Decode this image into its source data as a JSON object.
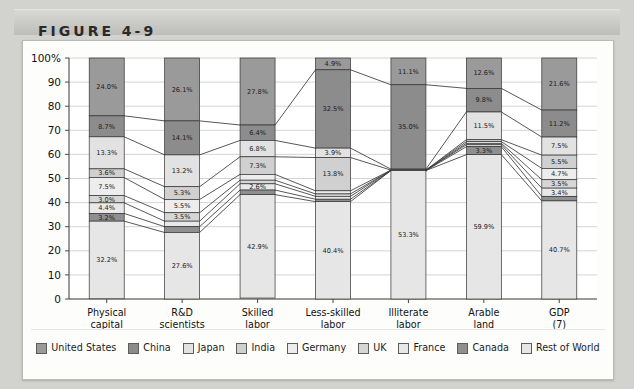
{
  "figure": {
    "label": "FIGURE 4-9"
  },
  "chart_data": {
    "type": "bar",
    "subtype": "stacked-percentage-with-connectors",
    "title": "",
    "xlabel": "",
    "ylabel": "",
    "ylim": [
      0,
      100
    ],
    "ytick_labels": [
      "100%",
      "90",
      "80",
      "70",
      "60",
      "50",
      "40",
      "30",
      "20",
      "10",
      "0"
    ],
    "ytick_values": [
      100,
      90,
      80,
      70,
      60,
      50,
      40,
      30,
      20,
      10,
      0
    ],
    "grid": true,
    "legend_position": "bottom",
    "categories": [
      "Physical capital",
      "R&D scientists",
      "Skilled labor",
      "Less-skilled labor",
      "Illiterate labor",
      "Arable land",
      "GDP"
    ],
    "category_lines": [
      [
        "Physical",
        "capital",
        "(1)"
      ],
      [
        "R&D",
        "scientists",
        "(2)"
      ],
      [
        "Skilled",
        "labor",
        "(3)"
      ],
      [
        "Less-skilled",
        "labor",
        "(4)"
      ],
      [
        "Illiterate",
        "labor",
        "(5)"
      ],
      [
        "Arable",
        "land",
        "(6)"
      ],
      [
        "GDP",
        "(7)"
      ]
    ],
    "series": [
      {
        "name": "United States",
        "color": "#9a9a9a",
        "values": [
          24.0,
          26.1,
          27.8,
          4.9,
          11.1,
          12.6,
          21.6
        ],
        "labels": [
          "24.0%",
          "26.1%",
          "27.8%",
          "4.9%",
          "11.1%",
          "12.6%",
          "21.6%"
        ]
      },
      {
        "name": "China",
        "color": "#8c8c8c",
        "values": [
          8.7,
          14.1,
          6.4,
          32.5,
          35.0,
          9.8,
          11.2
        ],
        "labels": [
          "8.7%",
          "14.1%",
          "6.4%",
          "32.5%",
          "35.0%",
          "9.8%",
          "11.2%"
        ]
      },
      {
        "name": "Japan",
        "color": "#e2e2e2",
        "values": [
          13.3,
          13.2,
          6.8,
          3.9,
          0.4,
          11.5,
          7.5
        ],
        "labels": [
          "13.3%",
          "13.2%",
          "6.8%",
          "3.9%",
          "",
          "11.5%",
          "7.5%"
        ]
      },
      {
        "name": "India",
        "color": "#d0d0d0",
        "values": [
          3.6,
          5.3,
          7.3,
          13.8,
          0.0,
          0.8,
          5.5
        ],
        "labels": [
          "3.6%",
          "5.3%",
          "7.3%",
          "13.8%",
          "",
          "",
          "5.5%"
        ]
      },
      {
        "name": "Germany",
        "color": "#ededed",
        "values": [
          7.5,
          5.5,
          2.4,
          1.3,
          0.1,
          0.7,
          4.7
        ],
        "labels": [
          "7.5%",
          "5.5%",
          "2.4%",
          "",
          "",
          "",
          "4.7%"
        ]
      },
      {
        "name": "UK",
        "color": "#d6d6d6",
        "values": [
          3.0,
          3.5,
          1.5,
          1.0,
          0.0,
          0.6,
          3.5
        ],
        "labels": [
          "3.0%",
          "3.5%",
          "",
          "",
          "",
          "",
          "3.5%"
        ]
      },
      {
        "name": "France",
        "color": "#e8e8e8",
        "values": [
          4.4,
          2.3,
          2.6,
          1.2,
          0.1,
          0.8,
          3.4
        ],
        "labels": [
          "4.4%",
          "",
          "2.6%",
          "",
          "",
          "",
          "3.4%"
        ]
      },
      {
        "name": "Canada",
        "color": "#8f8f8f",
        "values": [
          3.2,
          2.4,
          1.9,
          1.0,
          0.0,
          3.3,
          1.9
        ],
        "labels": [
          "3.2%",
          "",
          "",
          "",
          "",
          "3.3%",
          ""
        ]
      },
      {
        "name": "Rest of World",
        "color": "#e6e6e6",
        "values": [
          32.2,
          27.6,
          42.9,
          40.4,
          53.3,
          59.9,
          40.7
        ],
        "labels": [
          "32.2%",
          "27.6%",
          "42.9%",
          "40.4%",
          "53.3%",
          "59.9%",
          "40.7%"
        ]
      }
    ]
  },
  "legend": {
    "items": [
      {
        "label": "United States",
        "color": "#9a9a9a"
      },
      {
        "label": "China",
        "color": "#8c8c8c"
      },
      {
        "label": "Japan",
        "color": "#e2e2e2"
      },
      {
        "label": "India",
        "color": "#d0d0d0"
      },
      {
        "label": "Germany",
        "color": "#ededed"
      },
      {
        "label": "UK",
        "color": "#d6d6d6"
      },
      {
        "label": "France",
        "color": "#e8e8e8"
      },
      {
        "label": "Canada",
        "color": "#8f8f8f"
      },
      {
        "label": "Rest of World",
        "color": "#e6e6e6"
      }
    ]
  }
}
